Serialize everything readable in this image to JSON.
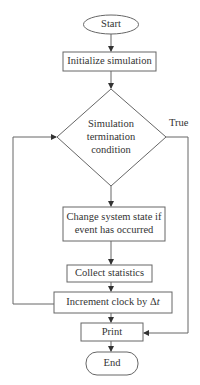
{
  "diagram": {
    "type": "flowchart",
    "nodes": {
      "start": {
        "label": "Start",
        "shape": "terminator"
      },
      "init": {
        "label": "Initialize simulation",
        "shape": "process"
      },
      "decision_l1": "Simulation",
      "decision_l2": "termination",
      "decision_l3": "condition",
      "change_l1": "Change system state if",
      "change_l2": "event has occurred",
      "collect": {
        "label": "Collect statistics",
        "shape": "process"
      },
      "increment": {
        "label_prefix": "Increment clock by Δ",
        "label_var": "t",
        "shape": "process"
      },
      "print": {
        "label": "Print",
        "shape": "process"
      },
      "end": {
        "label": "End",
        "shape": "terminator"
      }
    },
    "edges": [
      {
        "from": "Start",
        "to": "Initialize simulation"
      },
      {
        "from": "Initialize simulation",
        "to": "Simulation termination condition"
      },
      {
        "from": "Simulation termination condition",
        "to": "Change system state if event has occurred",
        "label": ""
      },
      {
        "from": "Simulation termination condition",
        "to": "Print",
        "label": "True"
      },
      {
        "from": "Change system state if event has occurred",
        "to": "Collect statistics"
      },
      {
        "from": "Collect statistics",
        "to": "Increment clock by Δt"
      },
      {
        "from": "Increment clock by Δt",
        "to": "Simulation termination condition",
        "label": "loop"
      },
      {
        "from": "Increment clock by Δt",
        "to": "Print"
      },
      {
        "from": "Print",
        "to": "End"
      }
    ],
    "true_label": "True",
    "colors": {
      "stroke": "#555555",
      "text": "#333333",
      "background": "#ffffff"
    }
  }
}
